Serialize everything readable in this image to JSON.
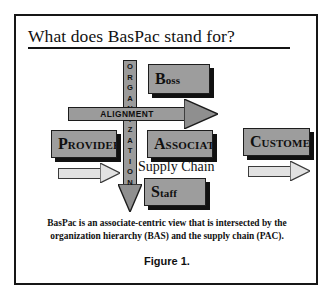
{
  "figure": {
    "title": "What does BasPac stand for?",
    "caption_line1": "BasPac is an associate-centric view that is intersected by the",
    "caption_line2": "organization hierarchy (BAS) and the supply chain (PAC).",
    "figure_label": "Figure 1.",
    "supply_chain_label": "Supply Chain",
    "frame_color": "#161616",
    "box_fill": "#9d9d9d",
    "box_shadow": "#111111",
    "arrow_fill": "#9b9b9b",
    "flow_arrow_fill": "#e2e2e2"
  },
  "vertical_axis": {
    "name": "ORGANIZATION",
    "letters": [
      "O",
      "R",
      "G",
      "A",
      "N",
      "I",
      "Z",
      "A",
      "T",
      "I",
      "O",
      "N"
    ],
    "direction": "down"
  },
  "horizontal_axis": {
    "name": "ALIGNMENT",
    "direction": "right"
  },
  "boxes": [
    {
      "id": "boss",
      "cap": "B",
      "rest": "oss",
      "full": "Boss"
    },
    {
      "id": "provider",
      "cap": "P",
      "rest": "ROVIDER",
      "full": "Provider"
    },
    {
      "id": "associate",
      "cap": "A",
      "rest": "SSOCIATE",
      "full": "Associate"
    },
    {
      "id": "customer",
      "cap": "C",
      "rest": "USTOMER",
      "full": "Customer"
    },
    {
      "id": "staff",
      "cap": "S",
      "rest": "taff",
      "full": "Staff"
    }
  ],
  "flow_arrows": [
    {
      "id": "provider-to-associate",
      "direction": "right"
    },
    {
      "id": "associate-to-customer",
      "direction": "right"
    }
  ]
}
